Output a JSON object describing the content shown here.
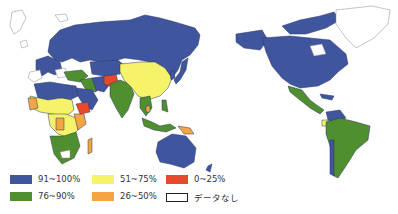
{
  "map": {
    "title": "",
    "projection": "Pacific-centered world map",
    "colors": {
      "c91_100": "#3f569f",
      "c76_90": "#4f8f2f",
      "c51_75": "#f4f36a",
      "c26_50": "#f2a541",
      "c0_25": "#e6492c",
      "nodata": "#ffffff",
      "border": "#2a3560"
    }
  },
  "legend": {
    "items": [
      {
        "label": "91~100%",
        "color": "#3f569f"
      },
      {
        "label": "51~75%",
        "color": "#f4f36a"
      },
      {
        "label": "0~25%",
        "color": "#e6492c"
      },
      {
        "label": "76~90%",
        "color": "#4f8f2f"
      },
      {
        "label": "26~50%",
        "color": "#f2a541"
      },
      {
        "label": "データなし",
        "color": "#ffffff"
      }
    ]
  }
}
